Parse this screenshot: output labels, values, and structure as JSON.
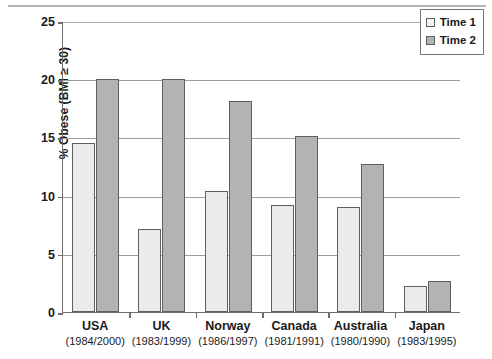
{
  "chart_data": {
    "type": "bar",
    "title": "",
    "subtitle": "",
    "xlabel": "",
    "ylabel": "% Obese (BMI ≥ 30)",
    "ylim": [
      0,
      25
    ],
    "yticks": [
      0,
      5,
      10,
      15,
      20,
      25
    ],
    "ytick_labels": [
      "0",
      "5",
      "10",
      "15",
      "20",
      "25"
    ],
    "grid": true,
    "legend_position": "top-right",
    "categories": [
      "USA",
      "UK",
      "Norway",
      "Canada",
      "Australia",
      "Japan"
    ],
    "category_sublabels": [
      "(1984/2000)",
      "(1983/1999)",
      "(1986/1997)",
      "(1981/1991)",
      "(1980/1990)",
      "(1983/1995)"
    ],
    "series": [
      {
        "name": "Time 1",
        "color": "#ebebeb",
        "values": [
          14.5,
          7.1,
          10.4,
          9.2,
          9.0,
          2.2
        ]
      },
      {
        "name": "Time 2",
        "color": "#b3b3b3",
        "values": [
          20.0,
          20.0,
          18.1,
          15.1,
          12.7,
          2.7
        ]
      }
    ]
  },
  "legend": {
    "items": [
      {
        "label": "Time 1",
        "swatch": "light-gray-swatch"
      },
      {
        "label": "Time 2",
        "swatch": "medium-gray-swatch"
      }
    ]
  },
  "axis": {
    "y_title": "% Obese (BMI ≥ 30)"
  }
}
